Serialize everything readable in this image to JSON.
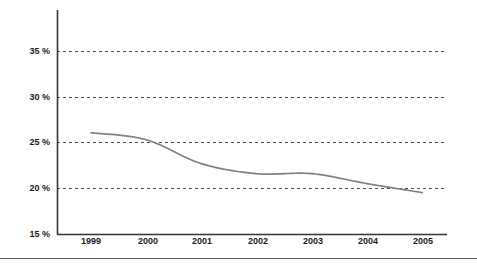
{
  "chart_data": {
    "type": "line",
    "title": "",
    "subtitle": "",
    "xlabel": "",
    "ylabel": "",
    "categories": [
      "1999",
      "2000",
      "2001",
      "2002",
      "2003",
      "2004",
      "2005"
    ],
    "x": [
      1999,
      2000,
      2001,
      2002,
      2003,
      2004,
      2005
    ],
    "series": [
      {
        "name": "",
        "color": "#808080",
        "values": [
          25.2,
          24.5,
          22.1,
          21.1,
          21.1,
          20.1,
          19.2
        ]
      }
    ],
    "ylim": [
      15,
      37.5
    ],
    "xlim": [
      1998.4,
      2005.6
    ],
    "ytick_values": [
      15,
      20,
      25,
      30,
      35
    ],
    "ytick_labels": [
      "15 %",
      "20 %",
      "25 %",
      "30 %",
      "35 %"
    ],
    "xtick_labels": [
      "1999",
      "2000",
      "2001",
      "2002",
      "2003",
      "2004",
      "2005"
    ],
    "grid": "horizontal-dashed",
    "grid_color": "#4d4d4d",
    "axis_color": "#333333",
    "legend": "none",
    "annotations": []
  },
  "axes": {
    "y_axis_name": "percent-axis",
    "x_axis_name": "year-axis"
  },
  "footer": {
    "rule_color": "#5a5a5a"
  }
}
